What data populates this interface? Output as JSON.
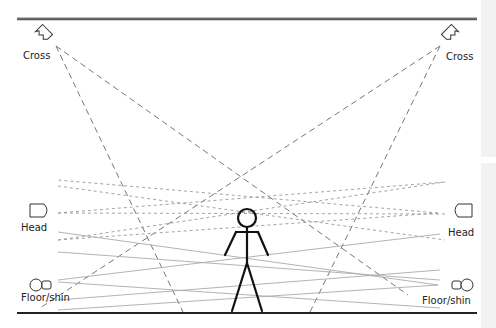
{
  "diagram": {
    "title": "",
    "lights": [
      {
        "id": "cross-left",
        "label": "Cross",
        "type": "cross-light",
        "side": "left"
      },
      {
        "id": "cross-right",
        "label": "Cross",
        "type": "cross-light",
        "side": "right"
      },
      {
        "id": "head-left",
        "label": "Head",
        "type": "head-light",
        "side": "left"
      },
      {
        "id": "head-right",
        "label": "Head",
        "type": "head-light",
        "side": "right"
      },
      {
        "id": "floor-left",
        "label": "Floor/shin",
        "type": "floor-light",
        "side": "left"
      },
      {
        "id": "floor-right",
        "label": "Floor/shin",
        "type": "floor-light",
        "side": "right"
      }
    ],
    "colors": {
      "line": "#888888",
      "stroke": "#222222",
      "truss": "#555555",
      "panel": "#f2f2f2"
    }
  }
}
